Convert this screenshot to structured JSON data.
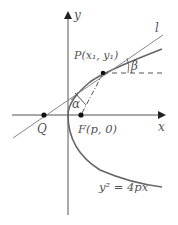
{
  "diagram": {
    "axes": {
      "x_label": "x",
      "y_label": "y"
    },
    "points": {
      "P": {
        "label": "P(x₁, y₁)"
      },
      "Q": {
        "label": "Q"
      },
      "F": {
        "label": "F(p, 0)"
      }
    },
    "line_label": "l",
    "angles": {
      "alpha": "α",
      "beta": "β"
    },
    "equation": "y² = 4px",
    "colors": {
      "axis": "#555555",
      "curve": "#666666",
      "line": "#888888",
      "point": "#111111"
    }
  }
}
